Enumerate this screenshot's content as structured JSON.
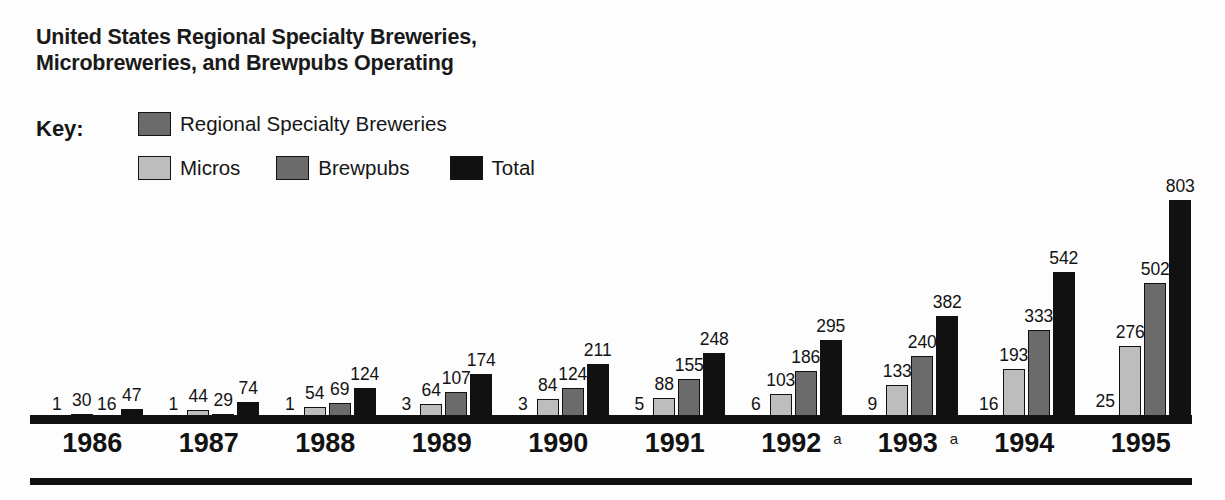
{
  "title": {
    "line1": "United States Regional Specialty Breweries,",
    "line2": "Microbreweries, and Brewpubs Operating"
  },
  "legend": {
    "key_label": "Key:",
    "items": [
      {
        "label": "Regional Specialty Breweries",
        "color": "#6b6b6b"
      },
      {
        "label": "Micros",
        "color": "#bdbdbd"
      },
      {
        "label": "Brewpubs",
        "color": "#6b6b6b"
      },
      {
        "label": "Total",
        "color": "#111111"
      }
    ]
  },
  "footnote_marker": "a",
  "chart_data": {
    "type": "bar",
    "title": "United States Regional Specialty Breweries, Microbreweries, and Brewpubs Operating",
    "xlabel": "",
    "ylabel": "",
    "ylim": [
      0,
      803
    ],
    "grid": false,
    "legend_position": "top-left",
    "categories": [
      "1986",
      "1987",
      "1988",
      "1989",
      "1990",
      "1991",
      "1992",
      "1993",
      "1994",
      "1995"
    ],
    "category_footnotes": [
      "",
      "",
      "",
      "",
      "",
      "",
      "a",
      "a",
      "",
      ""
    ],
    "series": [
      {
        "name": "Regional Specialty Breweries",
        "color": "#6b6b6b",
        "values": [
          1,
          1,
          1,
          3,
          3,
          5,
          6,
          9,
          16,
          25
        ]
      },
      {
        "name": "Micros",
        "color": "#bdbdbd",
        "values": [
          30,
          44,
          54,
          64,
          84,
          88,
          103,
          133,
          193,
          276
        ]
      },
      {
        "name": "Brewpubs",
        "color": "#6b6b6b",
        "values": [
          16,
          29,
          69,
          107,
          124,
          155,
          186,
          240,
          333,
          502
        ]
      },
      {
        "name": "Total",
        "color": "#111111",
        "values": [
          47,
          74,
          124,
          174,
          211,
          248,
          295,
          382,
          542,
          803
        ]
      }
    ]
  }
}
